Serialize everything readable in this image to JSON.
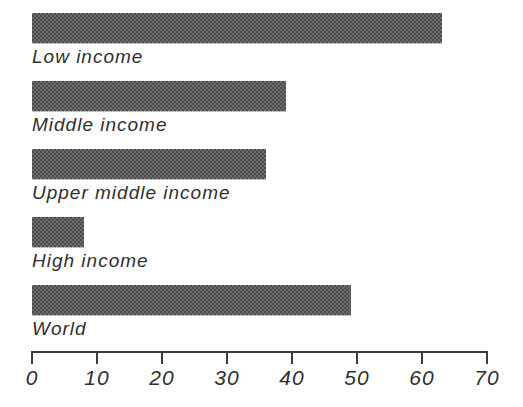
{
  "figure": {
    "bars": [
      {
        "label": "Low income",
        "value": 63
      },
      {
        "label": "Middle income",
        "value": 39
      },
      {
        "label": "Upper middle income",
        "value": 36
      },
      {
        "label": "High income",
        "value": 8
      },
      {
        "label": "World",
        "value": 49
      }
    ],
    "axis": {
      "min": 0,
      "max": 70,
      "tick_labels": [
        "0",
        "10",
        "20",
        "30",
        "40",
        "50",
        "60",
        "70"
      ]
    }
  },
  "chart_data": {
    "type": "bar",
    "orientation": "horizontal",
    "categories": [
      "Low income",
      "Middle income",
      "Upper middle income",
      "High income",
      "World"
    ],
    "values": [
      63,
      39,
      36,
      8,
      49
    ],
    "title": "",
    "xlabel": "",
    "ylabel": "",
    "xlim": [
      0,
      70
    ],
    "xticks": [
      0,
      10,
      20,
      30,
      40,
      50,
      60,
      70
    ],
    "grid": false,
    "legend": false,
    "label_position": "below-bar"
  },
  "colors": {
    "background": "#ffffff",
    "bar_mid": "#5a5a5a",
    "bar_dark": "#4c4c4c",
    "bar_light": "#6e6e6e",
    "axis": "#3c3c3c",
    "text": "#2f2f2f"
  }
}
